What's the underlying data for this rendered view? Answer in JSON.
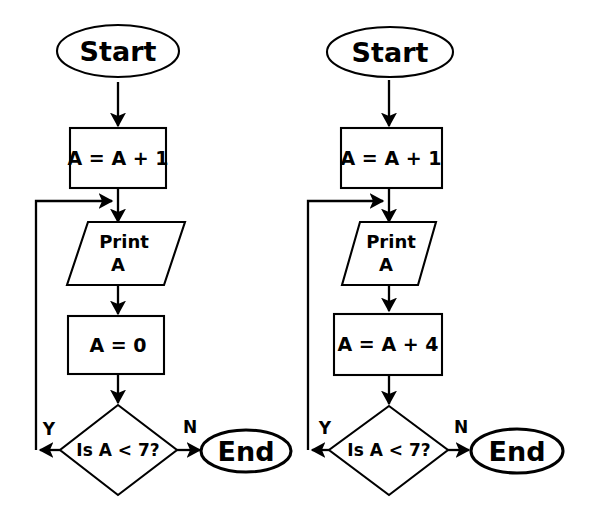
{
  "diagram": {
    "background_color": "#ffffff",
    "line_color": "#000000",
    "charts": [
      {
        "id": "left-flowchart",
        "name": "left-flowchart",
        "nodes": {
          "start": "Start",
          "increment": "A = A + 1",
          "print_line1": "Print",
          "print_line2": "A",
          "assign": "A = 0",
          "decision": "Is A < 7?",
          "end": "End"
        },
        "branches": {
          "yes": "Y",
          "no": "N"
        }
      },
      {
        "id": "right-flowchart",
        "name": "right-flowchart",
        "nodes": {
          "start": "Start",
          "increment": "A = A + 1",
          "print_line1": "Print",
          "print_line2": "A",
          "assign": "A = A + 4",
          "decision": "Is A < 7?",
          "end": "End"
        },
        "branches": {
          "yes": "Y",
          "no": "N"
        }
      }
    ]
  }
}
